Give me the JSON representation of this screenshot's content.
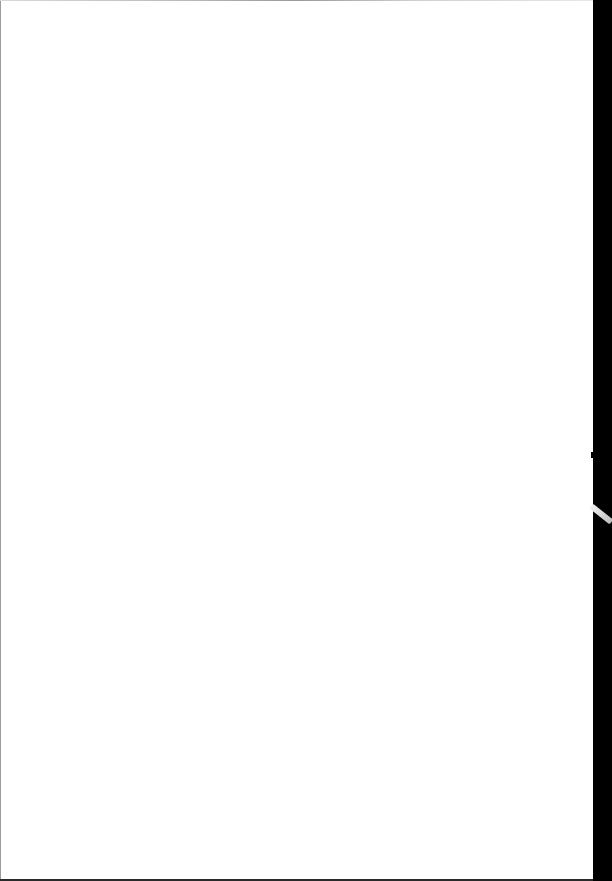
{
  "document": {
    "type": "blank-scanned-page",
    "content": "",
    "page_color": "#ffffff",
    "border_band_color": "#000000"
  }
}
